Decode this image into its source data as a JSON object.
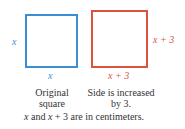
{
  "colors": {
    "original": "#3a8fd4",
    "increased": "#d9533f",
    "text": "#333333"
  },
  "original_square": {
    "side_left_label": "x",
    "side_bottom_label": "x",
    "caption_line1": "Original",
    "caption_line2": "square"
  },
  "increased_square": {
    "side_right_label": "x + 3",
    "side_bottom_label": "x + 3",
    "caption_line1": "Side is increased",
    "caption_line2": "by 3."
  },
  "footnote": {
    "var1": "x",
    "text1": " and ",
    "var2": "x",
    "text2": " + 3 are in centimeters."
  }
}
